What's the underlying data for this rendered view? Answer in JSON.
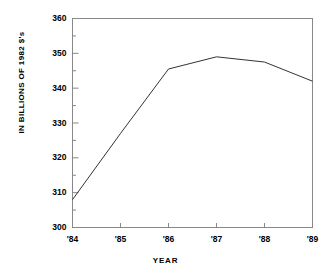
{
  "chart_data": {
    "type": "line",
    "title": "",
    "xlabel": "YEAR",
    "ylabel": "IN BILLIONS OF 1982 $'s",
    "categories": [
      "'84",
      "'85",
      "'86",
      "'87",
      "'88",
      "'89"
    ],
    "x": [
      1984,
      1985,
      1986,
      1987,
      1988,
      1989
    ],
    "values": [
      308,
      327,
      345.5,
      349,
      347.5,
      342
    ],
    "series": [
      {
        "name": "",
        "values": [
          308,
          327,
          345.5,
          349,
          347.5,
          342
        ]
      }
    ],
    "ylim": [
      300,
      360
    ],
    "xlim": [
      "'84",
      "'89"
    ],
    "ytick_labels": [
      "300",
      "310",
      "320",
      "330",
      "340",
      "350",
      "360"
    ],
    "ytick_values": [
      300,
      310,
      320,
      330,
      340,
      350,
      360
    ],
    "yminor_values": [
      305,
      315,
      325,
      335,
      345,
      355
    ],
    "xtick_labels": [
      "'84",
      "'85",
      "'86",
      "'87",
      "'88",
      "'89"
    ],
    "grid": false,
    "legend": "none",
    "line_color": "#333333",
    "frame_color": "#888888",
    "background": "#ffffff"
  },
  "axes": {
    "y_title": "IN BILLIONS OF 1982 $'s",
    "x_title": "YEAR"
  }
}
